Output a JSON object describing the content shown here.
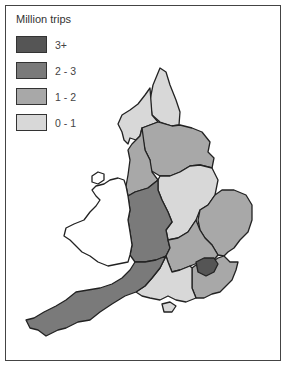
{
  "legend": {
    "title": "Million trips",
    "items": [
      {
        "label": "3+",
        "color": "#555555"
      },
      {
        "label": "2 - 3",
        "color": "#7a7a7a"
      },
      {
        "label": "1 - 2",
        "color": "#a8a8a8"
      },
      {
        "label": "0 - 1",
        "color": "#d8d8d8"
      }
    ]
  },
  "map": {
    "subject": "England regions (Wales unshaded)",
    "regions": [
      {
        "name": "Northern",
        "category": "0 - 1"
      },
      {
        "name": "Cumbria / North West coast",
        "category": "0 - 1"
      },
      {
        "name": "Yorkshire & Humberside",
        "category": "1 - 2"
      },
      {
        "name": "North West",
        "category": "1 - 2"
      },
      {
        "name": "East Midlands",
        "category": "0 - 1"
      },
      {
        "name": "Heart of England / West Midlands",
        "category": "2 - 3"
      },
      {
        "name": "East Anglia",
        "category": "1 - 2"
      },
      {
        "name": "Thames & Chilterns",
        "category": "1 - 2"
      },
      {
        "name": "West Country",
        "category": "2 - 3"
      },
      {
        "name": "Southern",
        "category": "0 - 1"
      },
      {
        "name": "South East",
        "category": "1 - 2"
      },
      {
        "name": "London",
        "category": "3+"
      },
      {
        "name": "Wales",
        "category": "none"
      }
    ]
  }
}
